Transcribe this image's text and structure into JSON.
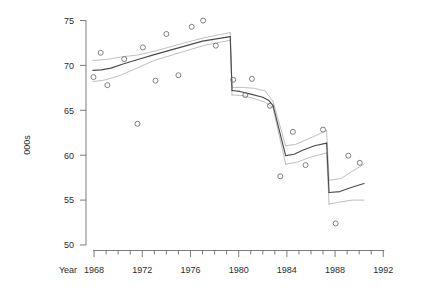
{
  "chart_data": {
    "type": "scatter",
    "title": "",
    "subtitle": "",
    "xlabel": "Year",
    "ylabel": "000s",
    "xlim": [
      1967,
      1993
    ],
    "ylim": [
      50,
      75
    ],
    "grid": false,
    "legend": "none",
    "x_ticks_major": [
      1968,
      1972,
      1976,
      1980,
      1984,
      1988,
      1992
    ],
    "x_tick_labels": [
      "1968",
      "1972",
      "1976",
      "1980",
      "1984",
      "1988",
      "1992"
    ],
    "x_ticks_minor": [
      1969,
      1970,
      1971,
      1973,
      1974,
      1975,
      1977,
      1978,
      1979,
      1981,
      1982,
      1983,
      1985,
      1986,
      1987,
      1989,
      1990,
      1991
    ],
    "y_ticks": [
      50,
      55,
      60,
      65,
      70,
      75
    ],
    "y_tick_labels": [
      "50",
      "55",
      "60",
      "65",
      "70",
      "75"
    ],
    "series": [
      {
        "name": "observations",
        "type": "scatter",
        "marker": "open-circle",
        "color": "#6a6a6a",
        "points": [
          {
            "x": 1967.95,
            "y": 68.7
          },
          {
            "x": 1968.55,
            "y": 71.4
          },
          {
            "x": 1969.1,
            "y": 67.8
          },
          {
            "x": 1970.5,
            "y": 70.7
          },
          {
            "x": 1971.6,
            "y": 63.5
          },
          {
            "x": 1972.05,
            "y": 72.0
          },
          {
            "x": 1973.1,
            "y": 68.3
          },
          {
            "x": 1974.0,
            "y": 73.5
          },
          {
            "x": 1975.0,
            "y": 68.9
          },
          {
            "x": 1976.1,
            "y": 74.3
          },
          {
            "x": 1977.05,
            "y": 75.0
          },
          {
            "x": 1978.1,
            "y": 72.2
          },
          {
            "x": 1979.55,
            "y": 68.4
          },
          {
            "x": 1980.55,
            "y": 66.7
          },
          {
            "x": 1981.1,
            "y": 68.5
          },
          {
            "x": 1982.6,
            "y": 65.5
          },
          {
            "x": 1983.45,
            "y": 57.65
          },
          {
            "x": 1984.5,
            "y": 62.6
          },
          {
            "x": 1985.55,
            "y": 58.9
          },
          {
            "x": 1987.0,
            "y": 62.85
          },
          {
            "x": 1988.05,
            "y": 52.4
          },
          {
            "x": 1989.1,
            "y": 59.95
          },
          {
            "x": 1990.05,
            "y": 59.15
          }
        ]
      },
      {
        "name": "fitted-segmented-trend",
        "type": "line",
        "color": "#4a4a4a",
        "segments": [
          [
            {
              "x": 1967.9,
              "y": 69.45
            },
            {
              "x": 1968.6,
              "y": 69.5
            },
            {
              "x": 1969.4,
              "y": 69.7
            },
            {
              "x": 1970.4,
              "y": 70.15
            },
            {
              "x": 1971.5,
              "y": 70.6
            },
            {
              "x": 1973.0,
              "y": 71.2
            },
            {
              "x": 1975.0,
              "y": 71.95
            },
            {
              "x": 1977.0,
              "y": 72.7
            },
            {
              "x": 1979.3,
              "y": 73.2
            }
          ],
          [
            {
              "x": 1979.45,
              "y": 67.2
            },
            {
              "x": 1980.1,
              "y": 67.1
            },
            {
              "x": 1981.0,
              "y": 66.8
            },
            {
              "x": 1982.0,
              "y": 66.45
            },
            {
              "x": 1982.5,
              "y": 66.1
            },
            {
              "x": 1982.85,
              "y": 65.55
            }
          ],
          [
            {
              "x": 1983.9,
              "y": 59.95
            },
            {
              "x": 1984.6,
              "y": 60.1
            },
            {
              "x": 1985.4,
              "y": 60.6
            },
            {
              "x": 1986.3,
              "y": 61.05
            },
            {
              "x": 1987.3,
              "y": 61.35
            }
          ],
          [
            {
              "x": 1987.5,
              "y": 55.85
            },
            {
              "x": 1988.4,
              "y": 55.95
            },
            {
              "x": 1989.2,
              "y": 56.35
            },
            {
              "x": 1990.4,
              "y": 56.85
            }
          ]
        ]
      },
      {
        "name": "upper-confidence-band",
        "type": "line",
        "color": "#b4b4b4",
        "segments": [
          [
            {
              "x": 1967.9,
              "y": 70.55
            },
            {
              "x": 1969.0,
              "y": 70.65
            },
            {
              "x": 1970.3,
              "y": 70.95
            },
            {
              "x": 1971.6,
              "y": 71.15
            },
            {
              "x": 1973.2,
              "y": 71.65
            },
            {
              "x": 1975.2,
              "y": 72.4
            },
            {
              "x": 1977.2,
              "y": 73.1
            },
            {
              "x": 1979.3,
              "y": 73.65
            }
          ],
          [
            {
              "x": 1979.45,
              "y": 67.55
            },
            {
              "x": 1980.3,
              "y": 67.55
            },
            {
              "x": 1981.3,
              "y": 67.45
            },
            {
              "x": 1982.2,
              "y": 67.15
            },
            {
              "x": 1982.85,
              "y": 66.0
            }
          ],
          [
            {
              "x": 1983.9,
              "y": 61.05
            },
            {
              "x": 1984.7,
              "y": 61.2
            },
            {
              "x": 1985.6,
              "y": 61.7
            },
            {
              "x": 1986.5,
              "y": 62.25
            },
            {
              "x": 1987.3,
              "y": 62.75
            }
          ],
          [
            {
              "x": 1987.5,
              "y": 57.2
            },
            {
              "x": 1988.5,
              "y": 57.4
            },
            {
              "x": 1989.4,
              "y": 58.2
            },
            {
              "x": 1990.4,
              "y": 59.0
            }
          ]
        ]
      },
      {
        "name": "lower-confidence-band",
        "type": "line",
        "color": "#b4b4b4",
        "segments": [
          [
            {
              "x": 1967.9,
              "y": 68.2
            },
            {
              "x": 1968.8,
              "y": 68.35
            },
            {
              "x": 1970.0,
              "y": 68.8
            },
            {
              "x": 1971.4,
              "y": 69.6
            },
            {
              "x": 1973.0,
              "y": 70.55
            },
            {
              "x": 1975.2,
              "y": 71.45
            },
            {
              "x": 1977.2,
              "y": 72.25
            },
            {
              "x": 1979.3,
              "y": 72.8
            }
          ],
          [
            {
              "x": 1979.45,
              "y": 66.7
            },
            {
              "x": 1980.3,
              "y": 66.65
            },
            {
              "x": 1981.3,
              "y": 66.3
            },
            {
              "x": 1982.2,
              "y": 65.9
            },
            {
              "x": 1982.85,
              "y": 65.3
            }
          ],
          [
            {
              "x": 1983.9,
              "y": 59.0
            },
            {
              "x": 1984.8,
              "y": 59.2
            },
            {
              "x": 1985.8,
              "y": 59.7
            },
            {
              "x": 1986.7,
              "y": 60.05
            },
            {
              "x": 1987.3,
              "y": 60.25
            }
          ],
          [
            {
              "x": 1987.5,
              "y": 54.55
            },
            {
              "x": 1988.5,
              "y": 54.8
            },
            {
              "x": 1989.4,
              "y": 55.0
            },
            {
              "x": 1990.4,
              "y": 55.0
            }
          ]
        ]
      }
    ]
  },
  "axes": {
    "x_title": "Year",
    "y_title": "000s"
  },
  "colors": {
    "fit_line": "#4a4a4a",
    "band_line": "#b4b4b4",
    "point_stroke": "#6a6a6a",
    "axis": "#6d6d6d",
    "text": "#2b2b2b",
    "background": "#ffffff"
  }
}
